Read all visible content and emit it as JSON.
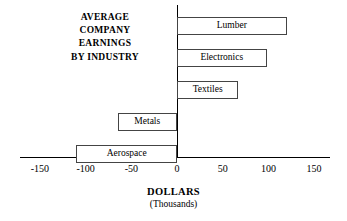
{
  "chart_data": {
    "type": "bar",
    "orientation": "horizontal",
    "title_lines": [
      "AVERAGE",
      "COMPANY",
      "EARNINGS",
      "BY INDUSTRY"
    ],
    "xlabel": "DOLLARS",
    "xlabel_sub": "(Thousands)",
    "ylabel": "",
    "categories": [
      "Lumber",
      "Electronics",
      "Textiles",
      "Metals",
      "Aerospace"
    ],
    "values": [
      120,
      98,
      67,
      -65,
      -110
    ],
    "xlim": [
      -150,
      150
    ],
    "xticks": [
      -150,
      -100,
      -50,
      0,
      50,
      100,
      150
    ],
    "xtick_labels": [
      "-150",
      "-100",
      "-50",
      "0",
      "50",
      "100",
      "150"
    ],
    "grid": false,
    "legend": false,
    "bars": [
      {
        "label": "Lumber",
        "value": 120
      },
      {
        "label": "Electronics",
        "value": 98
      },
      {
        "label": "Textiles",
        "value": 67
      },
      {
        "label": "Metals",
        "value": -65
      },
      {
        "label": "Aerospace",
        "value": -110
      }
    ],
    "colors": {
      "bar_fill": "#ffffff",
      "bar_border": "#444444",
      "axis": "#000000",
      "text": "#000000",
      "background": "#ffffff"
    }
  }
}
